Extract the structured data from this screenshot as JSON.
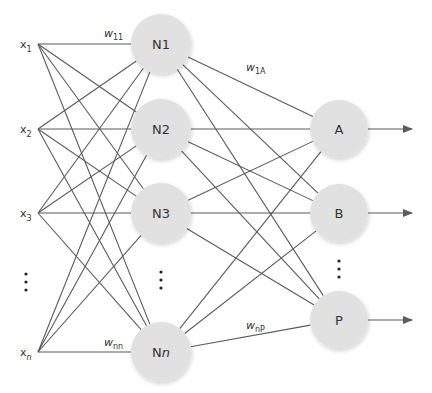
{
  "diagram": {
    "type": "feedforward-neural-network",
    "colors": {
      "node_fill": "#e1e1e1",
      "edge": "#5a5a5a",
      "text": "#333333"
    },
    "inputs": [
      {
        "id": "x1",
        "base": "x",
        "sub": "1",
        "y": 44
      },
      {
        "id": "x2",
        "base": "x",
        "sub": "2",
        "y": 129
      },
      {
        "id": "x3",
        "base": "x",
        "sub": "3",
        "y": 213
      },
      {
        "id": "xn",
        "base": "x",
        "sub": "n",
        "y": 352
      }
    ],
    "hidden": [
      {
        "id": "N1",
        "label": "N1",
        "y": 44
      },
      {
        "id": "N2",
        "label": "N2",
        "y": 129
      },
      {
        "id": "N3",
        "label": "N3",
        "y": 213
      },
      {
        "id": "Nn",
        "label": "Nn",
        "y": 352
      }
    ],
    "outputs": [
      {
        "id": "A",
        "label": "A",
        "y": 129
      },
      {
        "id": "B",
        "label": "B",
        "y": 213
      },
      {
        "id": "P",
        "label": "P",
        "y": 320
      }
    ],
    "weights": [
      {
        "base": "w",
        "sub": "11",
        "x": 104,
        "y": 37
      },
      {
        "base": "w",
        "sub": "nn",
        "x": 104,
        "y": 346
      },
      {
        "base": "w",
        "sub": "1A",
        "x": 246,
        "y": 71
      },
      {
        "base": "w",
        "sub": "nP",
        "x": 246,
        "y": 329
      }
    ],
    "ellipsis": "⋮"
  }
}
